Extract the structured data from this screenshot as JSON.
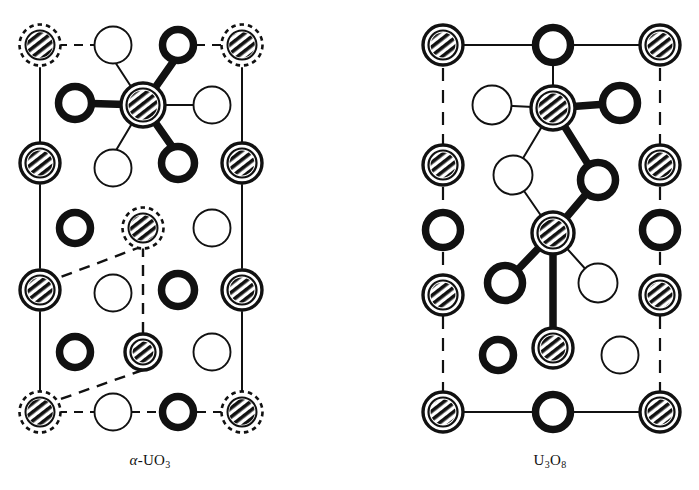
{
  "figure": {
    "background": "#ffffff",
    "ink_color": "#111111",
    "width": 699,
    "height": 490
  },
  "legend_semantics": {
    "hatched_double_ring": "uranium-atom",
    "hatched_dashed_ring": "uranium-atom-corner",
    "bold_ring": "oxygen-atom-bold",
    "thin_ring": "oxygen-atom-thin"
  },
  "panels": [
    {
      "id": "alpha-uo3",
      "caption_prefix": "α",
      "caption_dash": "-",
      "caption_element1": "U",
      "caption_element2": "O",
      "caption_subscript": "3",
      "caption_full": "α-UO3",
      "border_style": "solid-vertical-edges",
      "atoms": [
        {
          "x": 40,
          "y": 45,
          "type": "uranium-atom-corner",
          "r": 18
        },
        {
          "x": 113,
          "y": 45,
          "type": "oxygen-atom-thin",
          "r": 20
        },
        {
          "x": 178,
          "y": 45,
          "type": "oxygen-atom-bold",
          "r": 19
        },
        {
          "x": 242,
          "y": 45,
          "type": "uranium-atom-corner",
          "r": 18
        },
        {
          "x": 75,
          "y": 103,
          "type": "oxygen-atom-bold",
          "r": 20
        },
        {
          "x": 143,
          "y": 105,
          "type": "uranium-atom",
          "r": 22
        },
        {
          "x": 212,
          "y": 105,
          "type": "oxygen-atom-thin",
          "r": 20
        },
        {
          "x": 40,
          "y": 163,
          "type": "uranium-atom",
          "r": 20
        },
        {
          "x": 113,
          "y": 168,
          "type": "oxygen-atom-thin",
          "r": 20
        },
        {
          "x": 178,
          "y": 163,
          "type": "oxygen-atom-bold",
          "r": 20
        },
        {
          "x": 242,
          "y": 163,
          "type": "uranium-atom",
          "r": 20
        },
        {
          "x": 75,
          "y": 228,
          "type": "oxygen-atom-bold",
          "r": 19
        },
        {
          "x": 143,
          "y": 228,
          "type": "uranium-atom-corner",
          "r": 18
        },
        {
          "x": 212,
          "y": 228,
          "type": "oxygen-atom-thin",
          "r": 20
        },
        {
          "x": 40,
          "y": 290,
          "type": "uranium-atom",
          "r": 20
        },
        {
          "x": 113,
          "y": 293,
          "type": "oxygen-atom-thin",
          "r": 20
        },
        {
          "x": 178,
          "y": 290,
          "type": "oxygen-atom-bold",
          "r": 20
        },
        {
          "x": 242,
          "y": 290,
          "type": "uranium-atom",
          "r": 20
        },
        {
          "x": 75,
          "y": 352,
          "type": "oxygen-atom-bold",
          "r": 19
        },
        {
          "x": 143,
          "y": 352,
          "type": "uranium-atom",
          "r": 18
        },
        {
          "x": 212,
          "y": 352,
          "type": "oxygen-atom-thin",
          "r": 20
        },
        {
          "x": 40,
          "y": 412,
          "type": "uranium-atom-corner",
          "r": 18
        },
        {
          "x": 113,
          "y": 412,
          "type": "oxygen-atom-thin",
          "r": 20
        },
        {
          "x": 178,
          "y": 412,
          "type": "oxygen-atom-bold",
          "r": 19
        },
        {
          "x": 242,
          "y": 412,
          "type": "uranium-atom-corner",
          "r": 18
        }
      ],
      "bonds_thick": [
        {
          "x1": 75,
          "y1": 103,
          "x2": 143,
          "y2": 105
        },
        {
          "x1": 143,
          "y1": 105,
          "x2": 178,
          "y2": 55
        },
        {
          "x1": 143,
          "y1": 105,
          "x2": 178,
          "y2": 155
        }
      ],
      "bonds_thin": [
        {
          "x1": 143,
          "y1": 105,
          "x2": 212,
          "y2": 105
        },
        {
          "x1": 143,
          "y1": 105,
          "x2": 115,
          "y2": 62
        },
        {
          "x1": 143,
          "y1": 105,
          "x2": 115,
          "y2": 152
        }
      ],
      "bonds_dashed": [
        {
          "x1": 58,
          "y1": 45,
          "x2": 95,
          "y2": 45
        },
        {
          "x1": 196,
          "y1": 45,
          "x2": 224,
          "y2": 45
        },
        {
          "x1": 58,
          "y1": 412,
          "x2": 95,
          "y2": 412
        },
        {
          "x1": 131,
          "y1": 412,
          "x2": 159,
          "y2": 412
        },
        {
          "x1": 197,
          "y1": 412,
          "x2": 224,
          "y2": 412
        }
      ],
      "frame_lines": [
        {
          "x1": 40,
          "y1": 68,
          "x2": 40,
          "y2": 142
        },
        {
          "x1": 40,
          "y1": 185,
          "x2": 40,
          "y2": 268
        },
        {
          "x1": 40,
          "y1": 312,
          "x2": 40,
          "y2": 392
        },
        {
          "x1": 242,
          "y1": 68,
          "x2": 242,
          "y2": 142
        },
        {
          "x1": 242,
          "y1": 185,
          "x2": 242,
          "y2": 268
        },
        {
          "x1": 242,
          "y1": 312,
          "x2": 242,
          "y2": 392
        }
      ],
      "unit_cell_outline": [
        {
          "x": 143,
          "y": 228
        },
        {
          "x": 40,
          "y": 290
        },
        {
          "x": 143,
          "y": 352
        },
        {
          "x": 40,
          "y": 412
        }
      ],
      "unit_cell_edges": [
        {
          "x1": 143,
          "y1": 246,
          "x2": 58,
          "y2": 278
        },
        {
          "x1": 143,
          "y1": 246,
          "x2": 143,
          "y2": 334
        },
        {
          "x1": 143,
          "y1": 370,
          "x2": 58,
          "y2": 400
        }
      ]
    },
    {
      "id": "u3o8",
      "caption_element1": "U",
      "caption_subscript1": "3",
      "caption_element2": "O",
      "caption_subscript2": "8",
      "caption_full": "U3O8",
      "border_style": "dashed-vertical-edges",
      "atoms": [
        {
          "x": 443,
          "y": 45,
          "type": "uranium-atom",
          "r": 20
        },
        {
          "x": 553,
          "y": 45,
          "type": "oxygen-atom-bold",
          "r": 21
        },
        {
          "x": 660,
          "y": 45,
          "type": "uranium-atom",
          "r": 20
        },
        {
          "x": 492,
          "y": 105,
          "type": "oxygen-atom-thin",
          "r": 21
        },
        {
          "x": 553,
          "y": 108,
          "type": "uranium-atom",
          "r": 22
        },
        {
          "x": 620,
          "y": 103,
          "type": "oxygen-atom-bold",
          "r": 21
        },
        {
          "x": 443,
          "y": 165,
          "type": "uranium-atom",
          "r": 20
        },
        {
          "x": 513,
          "y": 175,
          "type": "oxygen-atom-thin",
          "r": 21
        },
        {
          "x": 598,
          "y": 180,
          "type": "oxygen-atom-bold",
          "r": 21
        },
        {
          "x": 660,
          "y": 165,
          "type": "uranium-atom",
          "r": 20
        },
        {
          "x": 443,
          "y": 230,
          "type": "oxygen-atom-bold",
          "r": 21
        },
        {
          "x": 553,
          "y": 233,
          "type": "uranium-atom",
          "r": 21
        },
        {
          "x": 660,
          "y": 230,
          "type": "oxygen-atom-bold",
          "r": 21
        },
        {
          "x": 505,
          "y": 283,
          "type": "oxygen-atom-bold",
          "r": 21
        },
        {
          "x": 598,
          "y": 283,
          "type": "oxygen-atom-thin",
          "r": 21
        },
        {
          "x": 443,
          "y": 295,
          "type": "uranium-atom",
          "r": 20
        },
        {
          "x": 660,
          "y": 295,
          "type": "uranium-atom",
          "r": 20
        },
        {
          "x": 553,
          "y": 348,
          "type": "uranium-atom",
          "r": 20
        },
        {
          "x": 498,
          "y": 355,
          "type": "oxygen-atom-bold",
          "r": 19
        },
        {
          "x": 620,
          "y": 355,
          "type": "oxygen-atom-thin",
          "r": 20
        },
        {
          "x": 443,
          "y": 412,
          "type": "uranium-atom",
          "r": 20
        },
        {
          "x": 553,
          "y": 412,
          "type": "oxygen-atom-bold",
          "r": 21
        },
        {
          "x": 660,
          "y": 412,
          "type": "uranium-atom",
          "r": 20
        }
      ],
      "bonds_thick": [
        {
          "x1": 553,
          "y1": 108,
          "x2": 620,
          "y2": 103
        },
        {
          "x1": 553,
          "y1": 108,
          "x2": 598,
          "y2": 180
        },
        {
          "x1": 598,
          "y1": 180,
          "x2": 553,
          "y2": 233
        },
        {
          "x1": 553,
          "y1": 233,
          "x2": 505,
          "y2": 283
        },
        {
          "x1": 553,
          "y1": 233,
          "x2": 553,
          "y2": 348
        }
      ],
      "bonds_thin": [
        {
          "x1": 553,
          "y1": 45,
          "x2": 553,
          "y2": 108
        },
        {
          "x1": 553,
          "y1": 108,
          "x2": 492,
          "y2": 105
        },
        {
          "x1": 553,
          "y1": 108,
          "x2": 513,
          "y2": 175
        },
        {
          "x1": 553,
          "y1": 233,
          "x2": 598,
          "y2": 283
        },
        {
          "x1": 513,
          "y1": 175,
          "x2": 553,
          "y2": 233
        }
      ],
      "bonds_solid_row": [
        {
          "x1": 463,
          "y1": 45,
          "x2": 532,
          "y2": 45
        },
        {
          "x1": 574,
          "y1": 45,
          "x2": 640,
          "y2": 45
        },
        {
          "x1": 463,
          "y1": 412,
          "x2": 532,
          "y2": 412
        },
        {
          "x1": 574,
          "y1": 412,
          "x2": 640,
          "y2": 412
        }
      ],
      "frame_lines_dashed": [
        {
          "x1": 443,
          "y1": 68,
          "x2": 443,
          "y2": 145
        },
        {
          "x1": 443,
          "y1": 187,
          "x2": 443,
          "y2": 209
        },
        {
          "x1": 443,
          "y1": 252,
          "x2": 443,
          "y2": 274
        },
        {
          "x1": 443,
          "y1": 316,
          "x2": 443,
          "y2": 392
        },
        {
          "x1": 660,
          "y1": 68,
          "x2": 660,
          "y2": 145
        },
        {
          "x1": 660,
          "y1": 187,
          "x2": 660,
          "y2": 209
        },
        {
          "x1": 660,
          "y1": 252,
          "x2": 660,
          "y2": 274
        },
        {
          "x1": 660,
          "y1": 316,
          "x2": 660,
          "y2": 392
        }
      ]
    }
  ]
}
